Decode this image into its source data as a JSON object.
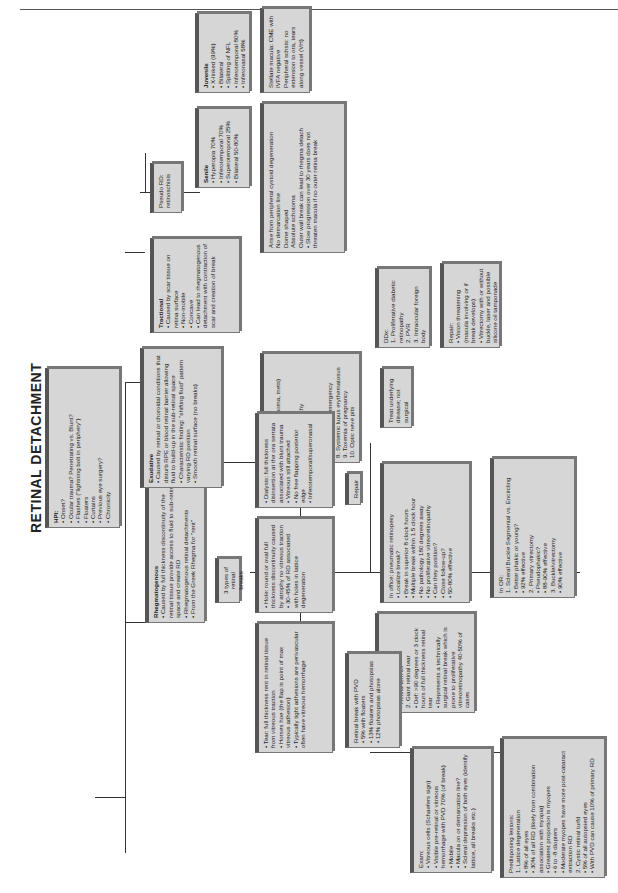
{
  "title": "RETINAL DETACHMENT",
  "hpi": {
    "heading": "HPI:",
    "items": [
      "• Onset?",
      "• Ocular trauma? Penetrating vs. Blunt?",
      "• Flashes (\"lightning bolt in periphery\")",
      "• Floaters",
      "• Curtains",
      "• Previous eye surgery?",
      "• Chronicity"
    ]
  },
  "rhegmatogenous": {
    "heading": "Rhegmatogenous",
    "items": [
      "• Caused by full thickness discontinuity of the retinal tissue provide access to fluid to sub-retinal space and create RD",
      "• Rhegmatogenous retinal detachments",
      "• From the Greek Rhegma for \"rent\""
    ]
  },
  "exudative": {
    "heading": "Exudative",
    "items": [
      "• Caused by retinal or choroidal conditions that disturb RPE or blood retinal barrier allowing fluid to build-up in the sub-retinal space",
      "• Characteristic finding: \"shifting fluid\" pattern varying RD position",
      "• Smooth retinal surface (no breaks)"
    ]
  },
  "tractional": {
    "heading": "Tractional",
    "items": [
      "• Caused by scar tissue on retina surface",
      "• Non-mobile",
      "• Concave",
      "• Can lead to rhegmatogenous detachment with contraction of scar and creation of break"
    ]
  },
  "pseudo_rd": {
    "label": "Pseudo RD: retinoschisis"
  },
  "senile": {
    "heading": "Senile",
    "items": [
      "• Hyperopia 70%",
      "• Inferotemporal 70%",
      "• Superotemporal 25%",
      "• Bilateral 50-80%"
    ]
  },
  "senile_detail": {
    "items": [
      "Arise from peripheral cystoid degeneration",
      "No demarcation line",
      "Dome shaped",
      "Absolute schotoma",
      "Outer wall break can lead to rhegma detach",
      "• Slow progression over 30 years does not threaten macula if no outer retina break"
    ]
  },
  "juvenile": {
    "heading": "Juvenile",
    "items": [
      "• X-linked (99%)",
      "• Bilateral",
      "• Splitting of NFL",
      "• Inferotemporal 80%",
      "• Inferonasal 58%"
    ]
  },
  "juvenile_detail": {
    "items": [
      "Stellate macula: CME with IVFA negative",
      "Peripheral schsis: no extension to ora, tears along vessel (VH)"
    ]
  },
  "exudative_ddx": {
    "heading": "DDx:",
    "items": [
      "1. Tumors (melanoma, mets)",
      "2. Hemangioma",
      "3. Central serous retinochoroidopathy",
      "4. Harada/VKH",
      "5. Coats disease",
      "6. Uveal effusion",
      "7. Hypertensive emergency",
      "8. Systemic lupus erythematosus",
      "9. Toxemia of pregnancy",
      "10. Optic neve pits"
    ]
  },
  "treat_underlying": {
    "label": "Treat underlying disease; not surgical"
  },
  "tractional_ddx": {
    "heading": "DDx:",
    "items": [
      "1. Proliferative diabetic retinopathy",
      "2. PVR",
      "3. Intraocular foreign body"
    ]
  },
  "tractional_repair": {
    "heading": "Repair:",
    "items": [
      "• Vision threatening (macula involving or if break develops)",
      "• Vitrectomy with or without buckle, laser and possible silicone oil tamponade"
    ]
  },
  "three_types": {
    "label": "3 types of retinal breaks"
  },
  "dialysis": {
    "items": [
      "• Dialysis: full thickness disinsertion at the ora serrata associated with blunt trauma",
      "• Vitreous still attached",
      "• No free flapping posterior edge",
      "• Inferotemporal/superonasal"
    ]
  },
  "hole": {
    "items": [
      "• Hole: round or oval full thickness discontinuity caused by atrophy no vitreous traction",
      "• 30-45% of RD associated with holes in lattice degeneration"
    ]
  },
  "tear": {
    "items": [
      "• Tear: full thickness rent in retinal tissue from vitreous traction",
      "• Horses hoe (the flap is point of max vitreous adhesion)",
      "• Typically tight adhesions are perivascular often have vitreous hemorrhage"
    ]
  },
  "repair_label": {
    "label": "Repair"
  },
  "in_office": {
    "heading": "In office: pneumatic retinopexy",
    "items": [
      "• Localize break?",
      "• Break in superior 8 clock hours",
      "• Multiple break within 1.5 clock hour",
      "• No pathology 180 degrees away",
      "• No proliferative vitreoretinopathy",
      "• Can they position?",
      "• Close follow-up?",
      "• 50-80% effective"
    ]
  },
  "in_or": {
    "heading": "In OR:",
    "items": [
      "1. Scleral Buckle Segmental vs. Encircling",
      "• Better phakic or young?",
      "• 92% effective",
      "2. Primary vitrectomy",
      "• Pseudophakic?",
      "• 88-90% effective",
      "3. Buckle/vitrectomy",
      "• 90% effective"
    ]
  },
  "other_breaks": {
    "heading": "Other breaks",
    "items": [
      "1. Operculum",
      "• Retina torn off",
      "2. Giant retinal tear",
      "• Def: >90 degrees or 3 clock hours of full thickness retinal tear",
      "• Represents a technically surgical retinal break which is prone to proliferative vitreoretinopathy 40-50% of cases"
    ]
  },
  "retinal_break_pvd": {
    "heading": "Retinal break with PVD",
    "items": [
      "• 5% with floaters",
      "• 13% floaters and photopsias",
      "• 12% photopsias alone"
    ]
  },
  "exam": {
    "heading": "Exam:",
    "items": [
      "• Vitreous cells (Schaefers sign)",
      "• Visible pre-retinal or vitreous hemorrhage with PVD 70% (of break)",
      "• Mobile",
      "• Macula on or demarcation line?",
      "• Scleral depression of both eyes (identify lattice, all breaks etc.)"
    ]
  },
  "predisposing": {
    "heading": "Predisposing lesions:",
    "items": [
      "1. Lattice degeneration",
      "• 8% of all eyes",
      "• 30% of all RD (likely from combination association with myopia)",
      "• Greatest proportion is myopes",
      "• 6 to -8 diopters",
      "• Moderate myopes have more post-cataract extraction RD",
      "2. Cystic retinal turfd",
      "• 5% of all autopsied eyes",
      "• With PVD can cause 10% of primary RD"
    ]
  }
}
